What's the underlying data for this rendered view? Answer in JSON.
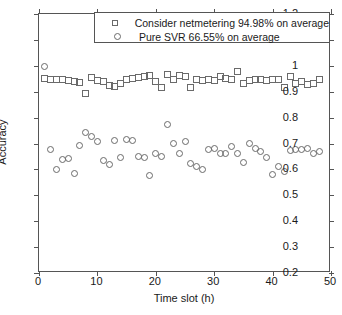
{
  "chart_data": {
    "type": "scatter",
    "title": "",
    "xlabel": "Time slot (h)",
    "ylabel": "Accuracy",
    "xlim": [
      0,
      50
    ],
    "ylim": [
      0.2,
      1.2
    ],
    "xticks": [
      0,
      10,
      20,
      30,
      40,
      50
    ],
    "xtick_labels": [
      "0",
      "10",
      "20",
      "30",
      "40",
      "50"
    ],
    "yticks": [
      0.2,
      0.3,
      0.4,
      0.5,
      0.6,
      0.7,
      0.8,
      0.9,
      1.0,
      1.1,
      1.2
    ],
    "ytick_labels": [
      "0.2",
      "0.3",
      "0.4",
      "0.5",
      "0.6",
      "0.7",
      "0.8",
      "0.9",
      "1",
      "1.1",
      "1.2"
    ],
    "grid": false,
    "legend_position": "top-right",
    "marker_color": "#6a6a6a",
    "series": [
      {
        "name": "Consider netmetering 94.98% on average",
        "marker": "square",
        "average": 94.98,
        "x": [
          1,
          2,
          3,
          4,
          5,
          6,
          7,
          8,
          9,
          10,
          11,
          12,
          13,
          14,
          15,
          16,
          17,
          18,
          19,
          20,
          21,
          22,
          23,
          24,
          25,
          26,
          27,
          28,
          29,
          30,
          31,
          32,
          33,
          34,
          35,
          36,
          37,
          38,
          39,
          40,
          41,
          42,
          43,
          44,
          45,
          46,
          47,
          48
        ],
        "values": [
          0.952,
          0.948,
          0.946,
          0.948,
          0.944,
          0.939,
          0.934,
          0.893,
          0.955,
          0.942,
          0.94,
          0.925,
          0.922,
          0.931,
          0.946,
          0.95,
          0.955,
          0.958,
          0.962,
          0.938,
          0.918,
          0.968,
          0.946,
          0.962,
          0.958,
          0.918,
          0.948,
          0.944,
          0.948,
          0.944,
          0.958,
          0.952,
          0.948,
          0.978,
          0.932,
          0.944,
          0.946,
          0.948,
          0.944,
          0.946,
          0.948,
          0.918,
          0.958,
          0.932,
          0.938,
          0.928,
          0.932,
          0.948
        ]
      },
      {
        "name": "Pure SVR 66.55% on average",
        "marker": "circle",
        "average": 66.55,
        "x": [
          1,
          2,
          3,
          4,
          5,
          6,
          7,
          8,
          9,
          10,
          11,
          12,
          13,
          14,
          15,
          16,
          17,
          18,
          19,
          20,
          21,
          22,
          23,
          24,
          25,
          26,
          27,
          28,
          29,
          30,
          31,
          32,
          33,
          34,
          35,
          36,
          37,
          38,
          39,
          40,
          41,
          42,
          43,
          44,
          45,
          46,
          47,
          48
        ],
        "values": [
          0.998,
          0.678,
          0.598,
          0.638,
          0.642,
          0.584,
          0.692,
          0.742,
          0.728,
          0.706,
          0.635,
          0.62,
          0.713,
          0.645,
          0.715,
          0.712,
          0.648,
          0.645,
          0.576,
          0.662,
          0.648,
          0.772,
          0.7,
          0.662,
          0.709,
          0.622,
          0.612,
          0.598,
          0.678,
          0.68,
          0.66,
          0.662,
          0.688,
          0.662,
          0.625,
          0.7,
          0.682,
          0.67,
          0.645,
          0.582,
          0.612,
          0.592,
          0.672,
          0.675,
          0.678,
          0.68,
          0.662,
          0.668
        ]
      }
    ]
  },
  "legend": {
    "entries": [
      {
        "label": "Consider netmetering 94.98% on average",
        "marker": "square"
      },
      {
        "label": "Pure SVR 66.55% on average",
        "marker": "circle"
      }
    ]
  }
}
